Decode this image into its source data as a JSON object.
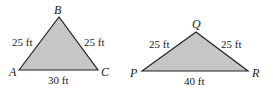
{
  "figures": [
    {
      "name": "triangle-ABC",
      "vertices": {
        "A": "A",
        "B": "B",
        "C": "C"
      },
      "sides": {
        "AB": "25 ft",
        "BC": "25 ft",
        "AC": "30 ft"
      },
      "fill": "#c6c6c6"
    },
    {
      "name": "triangle-PQR",
      "vertices": {
        "P": "P",
        "Q": "Q",
        "R": "R"
      },
      "sides": {
        "PQ": "25 ft",
        "QR": "25 ft",
        "PR": "40 ft"
      },
      "fill": "#c6c6c6"
    }
  ]
}
